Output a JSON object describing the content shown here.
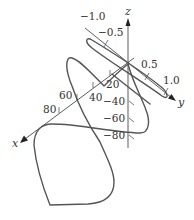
{
  "figure": {
    "type": "3D space curve with axes",
    "colors": {
      "axis": "#333333",
      "curve": "#555555",
      "background": "#ffffff"
    },
    "axes": {
      "x": {
        "label": "x",
        "ticks": [
          "20",
          "40",
          "60",
          "80"
        ]
      },
      "y": {
        "label": "y",
        "ticks": [
          "-1.0",
          "-0.5",
          "0.5",
          "1.0"
        ]
      },
      "z": {
        "label": "z",
        "ticks": [
          "-40",
          "-60",
          "-80"
        ]
      }
    },
    "tick_labels": {
      "y_neg1": "−1.0",
      "y_neg05": "−0.5",
      "y_pos05": "0.5",
      "y_pos1": "1.0",
      "x_20": "20",
      "x_40": "40",
      "x_60": "60",
      "x_80": "80",
      "z_neg40": "−40",
      "z_neg60": "−60",
      "z_neg80": "−80"
    }
  }
}
